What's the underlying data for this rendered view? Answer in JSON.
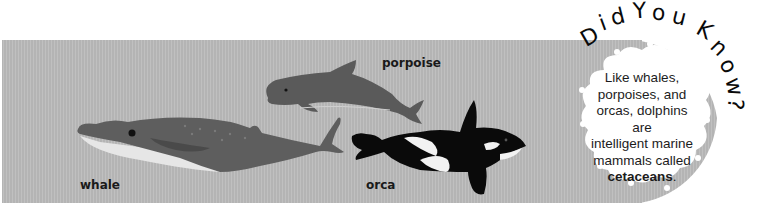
{
  "labels": {
    "whale": "whale",
    "porpoise": "porpoise",
    "orca": "orca"
  },
  "callout": {
    "heading": "Did You Know?",
    "heading_letters": [
      "D",
      "i",
      "d",
      " ",
      "Y",
      "o",
      "u",
      " ",
      "K",
      "n",
      "o",
      "w",
      "?"
    ],
    "text_lines": [
      "Like whales,",
      "porpoises, and",
      "orcas, dolphins are",
      "intelligent marine",
      "mammals called"
    ],
    "highlight": "cetaceans",
    "highlight_suffix": "."
  },
  "colors": {
    "band": "#b4b4b4",
    "whale_body": "#5e5e5e",
    "whale_belly": "#e6e6e6",
    "porpoise_body": "#5a5a5a",
    "orca_black": "#0a0a0a",
    "orca_white": "#f2f2f2",
    "cloud": "#ffffff",
    "text": "#1a1a1a"
  }
}
